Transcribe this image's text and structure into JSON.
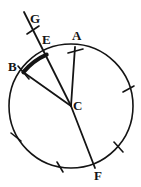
{
  "figure": {
    "kind": "circle-geometry-diagram",
    "background_color": "#ffffff",
    "stroke_color": "#141414",
    "labels": {
      "A": "A",
      "B": "B",
      "C": "C",
      "E": "E",
      "F": "F",
      "G": "G"
    },
    "circle": {
      "center_label": "C",
      "cx": 71,
      "cy": 106,
      "r": 62,
      "stroke_width": 1.6
    },
    "points": [
      {
        "label": "A",
        "x": 75,
        "y": 47,
        "on_circle": true
      },
      {
        "label": "B",
        "x": 23,
        "y": 72,
        "on_circle": true
      },
      {
        "label": "C",
        "x": 71,
        "y": 106,
        "on_circle": false
      },
      {
        "label": "E",
        "x": 47,
        "y": 55,
        "on_circle": true
      },
      {
        "label": "F",
        "x": 95,
        "y": 168,
        "on_circle": true
      },
      {
        "label": "G",
        "x": 26,
        "y": 19,
        "on_circle": false
      }
    ],
    "segments": [
      {
        "name": "radius-CA",
        "from": "C",
        "to": "A",
        "x1": 71,
        "y1": 106,
        "x2": 75,
        "y2": 47,
        "stroke_width": 1.7
      },
      {
        "name": "radius-CB",
        "from": "C",
        "to": "B",
        "x1": 71,
        "y1": 106,
        "x2": 23,
        "y2": 72,
        "stroke_width": 1.7
      },
      {
        "name": "ray-CG",
        "from": "C",
        "to": "G",
        "x1": 71,
        "y1": 106,
        "x2": 24,
        "y2": 12,
        "stroke_width": 1.7
      },
      {
        "name": "radius-CF",
        "from": "C",
        "to": "F",
        "x1": 71,
        "y1": 106,
        "x2": 95,
        "y2": 168,
        "stroke_width": 1.7
      }
    ],
    "bold_arc": {
      "name": "arc-BE",
      "from": "B",
      "to": "E",
      "stroke_width": 4.0,
      "description": "thick highlighted minor arc from B to E"
    },
    "tick_marks": [
      {
        "name": "tick-on-CG-near-G",
        "x": 33,
        "y": 30,
        "angle_deg": 115
      },
      {
        "name": "tick-at-A",
        "x": 75,
        "y": 47,
        "angle_deg": 100
      },
      {
        "name": "tick-at-B",
        "x": 23,
        "y": 72,
        "angle_deg": 20
      },
      {
        "name": "tick-circle-right",
        "x": 129,
        "y": 89,
        "angle_deg": 20
      },
      {
        "name": "tick-circle-lower-right",
        "x": 119,
        "y": 147,
        "angle_deg": 115
      },
      {
        "name": "tick-circle-bottom",
        "x": 60,
        "y": 167,
        "angle_deg": 75
      },
      {
        "name": "tick-circle-lower-left",
        "x": 16,
        "y": 137,
        "angle_deg": 55
      }
    ]
  }
}
